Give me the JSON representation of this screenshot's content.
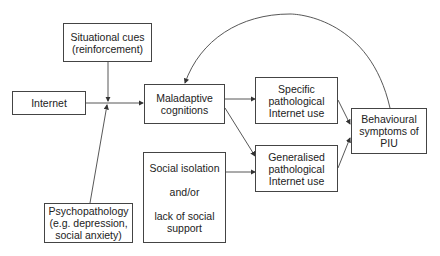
{
  "diagram": {
    "nodes": {
      "situational_cues": {
        "lines": [
          "Situational cues",
          "(reinforcement)"
        ]
      },
      "internet": {
        "lines": [
          "Internet"
        ]
      },
      "maladaptive": {
        "lines": [
          "Maladaptive",
          "cognitions"
        ]
      },
      "specific": {
        "lines": [
          "Specific",
          "pathological",
          "Internet use"
        ]
      },
      "generalised": {
        "lines": [
          "Generalised",
          "pathological",
          "Internet use"
        ]
      },
      "behavioural": {
        "lines": [
          "Behavioural",
          "symptoms of",
          "PIU"
        ]
      },
      "social": {
        "lines": [
          "Social isolation",
          "and/or",
          "lack of social",
          "support"
        ]
      },
      "psychopathology": {
        "lines": [
          "Psychopathology",
          "(e.g. depression,",
          "social anxiety)"
        ]
      }
    },
    "edges": [
      {
        "from": "internet",
        "to": "maladaptive"
      },
      {
        "from": "situational_cues",
        "to": "junction"
      },
      {
        "from": "psychopathology",
        "to": "junction"
      },
      {
        "from": "maladaptive",
        "to": "specific"
      },
      {
        "from": "maladaptive",
        "to": "generalised"
      },
      {
        "from": "social",
        "to": "generalised"
      },
      {
        "from": "specific",
        "to": "behavioural"
      },
      {
        "from": "generalised",
        "to": "behavioural"
      },
      {
        "from": "behavioural",
        "to": "maladaptive",
        "style": "curved-feedback"
      }
    ],
    "line_color": "#444444"
  }
}
